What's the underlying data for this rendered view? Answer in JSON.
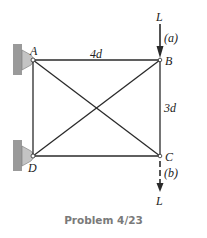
{
  "figure": {
    "caption": "Problem 4/23",
    "joints": {
      "A": {
        "label": "A",
        "x": 33,
        "y": 60
      },
      "B": {
        "label": "B",
        "x": 160,
        "y": 60
      },
      "C": {
        "label": "C",
        "x": 160,
        "y": 156
      },
      "D": {
        "label": "D",
        "x": 33,
        "y": 156
      }
    },
    "dimensions": {
      "horizontal": "4d",
      "vertical": "3d"
    },
    "loads": {
      "a": {
        "magnitude": "L",
        "case": "(a)",
        "at": "B",
        "direction": "down"
      },
      "b": {
        "magnitude": "L",
        "case": "(b)",
        "at": "C",
        "direction": "down"
      }
    },
    "supports": {
      "A": "pin-to-wall",
      "D": "pin-to-wall"
    },
    "colors": {
      "member": "#2a2a2a",
      "wall": "#9a9a9a",
      "support": "#c4c4c4",
      "caption": "#7a7a7a"
    }
  }
}
